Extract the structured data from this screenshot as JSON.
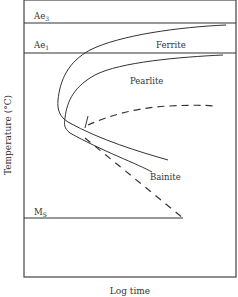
{
  "diagram": {
    "type": "TTT diagram (isothermal transformation)",
    "axes": {
      "xlabel": "Log time",
      "ylabel": "Temperature (°C)"
    },
    "reference_lines": [
      {
        "id": "ae3",
        "label_main": "Ae",
        "label_sub": "3"
      },
      {
        "id": "ae1",
        "label_main": "Ae",
        "label_sub": "1"
      },
      {
        "id": "ms",
        "label_main": "M",
        "label_sub": "S"
      }
    ],
    "regions": {
      "ferrite": "Ferrite",
      "pearlite": "Pearlite",
      "bainite": "Bainite"
    },
    "colors": {
      "line": "#333333",
      "frame": "#444444",
      "background": "#ffffff"
    }
  }
}
